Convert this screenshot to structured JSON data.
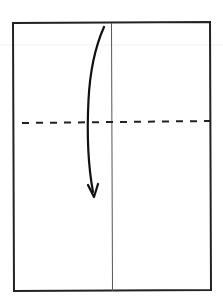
{
  "diagram": {
    "type": "origami-fold-step",
    "canvas": {
      "width": 223,
      "height": 308,
      "background": "#ffffff"
    },
    "paper": {
      "shape": "rectangle",
      "corners": {
        "top_left": [
          13,
          23
        ],
        "top_right": [
          210,
          22
        ],
        "bottom_right": [
          211,
          290
        ],
        "bottom_left": [
          14,
          291
        ]
      },
      "stroke": "#222222",
      "stroke_width": 2
    },
    "center_crease": {
      "style": "thin-solid",
      "x": 112,
      "y_start": 23,
      "y_end": 291,
      "stroke": "#555555"
    },
    "valley_fold_line": {
      "style": "dashed",
      "from": [
        22,
        123
      ],
      "to": [
        210,
        121
      ],
      "stroke": "#222222"
    },
    "fold_arrow": {
      "direction": "down",
      "meaning": "fold top edge down to the dashed line",
      "start": [
        104,
        27
      ],
      "end": [
        94,
        196
      ],
      "stroke": "#111111"
    },
    "scan_artifact_line": {
      "y": 45,
      "stroke": "#f0f0f0"
    }
  }
}
